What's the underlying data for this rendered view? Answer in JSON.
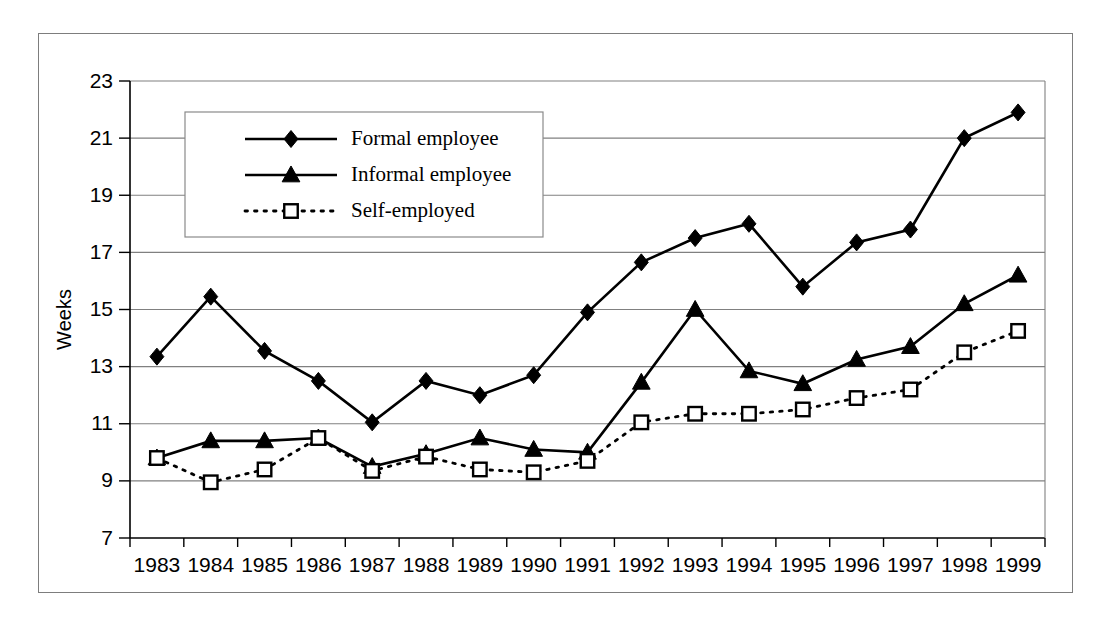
{
  "chart_data": {
    "type": "line",
    "title": "",
    "xlabel": "",
    "ylabel": "Weeks",
    "ylim": [
      7,
      23
    ],
    "ytick_step": 2,
    "yticks": [
      "7",
      "9",
      "11",
      "13",
      "15",
      "17",
      "19",
      "21",
      "23"
    ],
    "grid": true,
    "legend_position": "top-left-inside",
    "categories": [
      "1983",
      "1984",
      "1985",
      "1986",
      "1987",
      "1988",
      "1989",
      "1990",
      "1991",
      "1992",
      "1993",
      "1994",
      "1995",
      "1996",
      "1997",
      "1998",
      "1999"
    ],
    "series": [
      {
        "name": "Formal employee",
        "marker": "diamond-filled",
        "linestyle": "solid",
        "color": "#000000",
        "values": [
          13.35,
          15.45,
          13.55,
          12.5,
          11.05,
          12.5,
          12.0,
          12.7,
          14.9,
          16.65,
          17.5,
          18.0,
          15.8,
          17.35,
          17.8,
          21.0,
          21.9
        ]
      },
      {
        "name": "Informal employee",
        "marker": "triangle-filled",
        "linestyle": "solid",
        "color": "#000000",
        "values": [
          9.8,
          10.4,
          10.4,
          10.5,
          9.5,
          9.95,
          10.5,
          10.1,
          10.0,
          12.45,
          15.0,
          12.85,
          12.4,
          13.25,
          13.7,
          15.2,
          16.2
        ]
      },
      {
        "name": "Self-employed",
        "marker": "square-open",
        "linestyle": "dotted",
        "color": "#000000",
        "values": [
          9.8,
          8.95,
          9.4,
          10.5,
          9.35,
          9.85,
          9.4,
          9.3,
          9.7,
          11.05,
          11.35,
          11.35,
          11.5,
          11.9,
          12.2,
          13.5,
          14.25
        ]
      }
    ],
    "legend_entries": [
      "Formal employee",
      "Informal employee",
      "Self-employed"
    ]
  },
  "colors": {
    "ink": "#000000",
    "grid": "#808080",
    "frame": "#7d7d7d",
    "background": "#ffffff"
  }
}
